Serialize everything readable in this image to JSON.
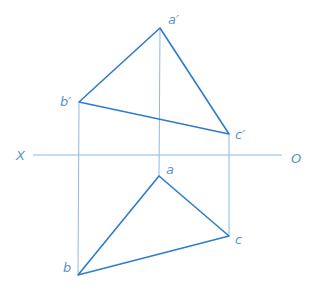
{
  "diagram": {
    "type": "orthographic-projection-triangle",
    "colors": {
      "edge": "#2f7cc8",
      "projector": "#8fb9e2",
      "label": "#5b95d0"
    },
    "axis": {
      "left_label": "X",
      "right_label": "O",
      "y": 155,
      "x1": 33,
      "x2": 282
    },
    "vertical_projection": {
      "points": [
        {
          "name": "a'",
          "x": 160,
          "y": 28
        },
        {
          "name": "b'",
          "x": 79,
          "y": 102
        },
        {
          "name": "c'",
          "x": 229,
          "y": 134
        }
      ]
    },
    "horizontal_projection": {
      "points": [
        {
          "name": "a",
          "x": 159,
          "y": 176
        },
        {
          "name": "b",
          "x": 78,
          "y": 275
        },
        {
          "name": "c",
          "x": 229,
          "y": 236
        }
      ]
    },
    "labels": {
      "a_prime": "a′",
      "b_prime": "b′",
      "c_prime": "c′",
      "a": "a",
      "b": "b",
      "c": "c",
      "X": "X",
      "O": "O"
    }
  }
}
